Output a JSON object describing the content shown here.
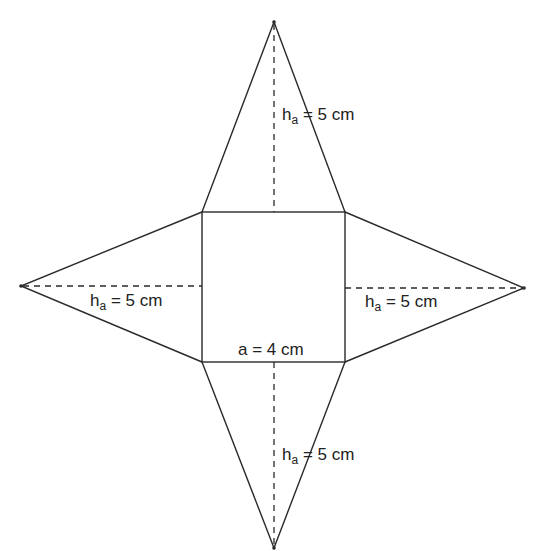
{
  "diagram": {
    "type": "net",
    "stroke_color": "#2a2a2a",
    "background": "#ffffff",
    "square": {
      "corners": [
        [
          202,
          212
        ],
        [
          345,
          212
        ],
        [
          345,
          362
        ],
        [
          202,
          362
        ]
      ],
      "side_label": {
        "prefix": "a = 4 cm",
        "var": "a",
        "value": "4",
        "unit": "cm"
      }
    },
    "triangles": [
      {
        "name": "top",
        "apex": [
          274,
          22
        ],
        "base": [
          [
            202,
            212
          ],
          [
            345,
            212
          ]
        ],
        "height_line": [
          [
            274,
            22
          ],
          [
            274,
            212
          ]
        ]
      },
      {
        "name": "left",
        "apex": [
          21,
          286
        ],
        "base": [
          [
            202,
            212
          ],
          [
            202,
            362
          ]
        ],
        "height_line": [
          [
            21,
            286
          ],
          [
            202,
            286
          ]
        ]
      },
      {
        "name": "right",
        "apex": [
          524,
          288
        ],
        "base": [
          [
            345,
            212
          ],
          [
            345,
            362
          ]
        ],
        "height_line": [
          [
            345,
            288
          ],
          [
            524,
            288
          ]
        ]
      },
      {
        "name": "bottom",
        "apex": [
          274,
          548
        ],
        "base": [
          [
            202,
            362
          ],
          [
            345,
            362
          ]
        ],
        "height_line": [
          [
            274,
            362
          ],
          [
            274,
            548
          ]
        ]
      }
    ]
  },
  "labels": {
    "top_height": {
      "base": "h",
      "sub": "a",
      "rest": " = 5 cm"
    },
    "left_height": {
      "base": "h",
      "sub": "a",
      "rest": " = 5 cm"
    },
    "right_height": {
      "base": "h",
      "sub": "a",
      "rest": " = 5 cm"
    },
    "bottom_height": {
      "base": "h",
      "sub": "a",
      "rest": " = 5 cm"
    },
    "square_side": "a = 4 cm"
  }
}
